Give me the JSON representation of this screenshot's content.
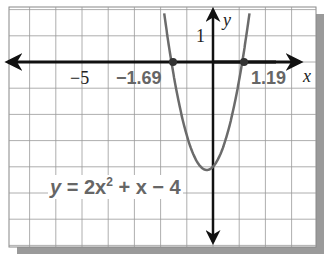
{
  "chart_data": {
    "type": "line",
    "title": "",
    "equation": "y = 2x^2 + x - 4",
    "xlabel": "x",
    "ylabel": "y",
    "xlim": [
      -8,
      4
    ],
    "ylim": [
      -7,
      2
    ],
    "grid": true,
    "series": [
      {
        "name": "y = 2x^2 + x - 4",
        "a": 2,
        "b": 1,
        "c": -4,
        "color": "#6b6b6b"
      }
    ],
    "roots": [
      -1.69,
      1.19
    ],
    "tick_labels": {
      "x": [
        "-5",
        "-1.69",
        "1.19"
      ],
      "y": [
        "1"
      ]
    },
    "annotations": [
      "y = 2x² + x − 4"
    ]
  },
  "labels": {
    "x_axis": "x",
    "y_axis": "y",
    "tick_neg5": "−5",
    "root_left": "−1.69",
    "root_right": "1.19",
    "tick_y1": "1",
    "eq_y": "y",
    "eq_mid": " = 2x",
    "eq_exp": "2",
    "eq_end": " + x − 4"
  }
}
